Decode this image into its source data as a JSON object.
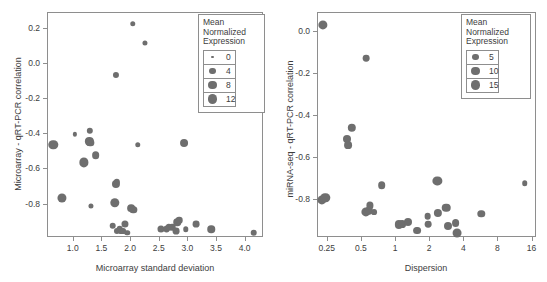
{
  "figure": {
    "title": "",
    "panels": [
      "left",
      "right"
    ]
  },
  "chart_data": [
    {
      "panel_id": "left",
      "type": "scatter",
      "title": "",
      "xlabel": "Microarray standard deviation",
      "ylabel": "Microarray - qRT-PCR correlation",
      "xscale": "linear",
      "yscale": "linear",
      "xlim": [
        0.55,
        4.32
      ],
      "ylim": [
        -0.99,
        0.29
      ],
      "xticks": [
        1.0,
        1.5,
        2.0,
        2.5,
        3.0,
        3.5,
        4.0
      ],
      "xticklabels": [
        "1.0",
        "1.5",
        "2.0",
        "2.5",
        "3.0",
        "3.5",
        "4.0"
      ],
      "yticks": [
        0.2,
        0.0,
        -0.2,
        -0.4,
        -0.6,
        -0.8
      ],
      "yticklabels": [
        "0.2",
        "0.0",
        "-0.2",
        "-0.4",
        "-0.6",
        "-0.8"
      ],
      "grid": false,
      "size_encoding": "Mean Normalized Expression",
      "marker_color": "#6e6e6e",
      "legend": {
        "position": "top-right",
        "title_lines": [
          "Mean",
          "Normalized",
          "Expression"
        ],
        "entries": [
          {
            "label": "0",
            "size": 0
          },
          {
            "label": "4",
            "size": 4
          },
          {
            "label": "8",
            "size": 8
          },
          {
            "label": "12",
            "size": 12
          }
        ]
      },
      "points": [
        {
          "x": 0.64,
          "y": -0.46,
          "size": 12.0
        },
        {
          "x": 0.8,
          "y": -0.76,
          "size": 11.0
        },
        {
          "x": 1.02,
          "y": -0.4,
          "size": 1.0
        },
        {
          "x": 1.17,
          "y": -0.56,
          "size": 11.5
        },
        {
          "x": 1.27,
          "y": -0.44,
          "size": 8.5
        },
        {
          "x": 1.28,
          "y": -0.38,
          "size": 4.0
        },
        {
          "x": 1.29,
          "y": -0.45,
          "size": 6.0
        },
        {
          "x": 1.3,
          "y": -0.81,
          "size": 2.0
        },
        {
          "x": 1.38,
          "y": -0.52,
          "size": 7.0
        },
        {
          "x": 1.68,
          "y": -0.92,
          "size": 4.5
        },
        {
          "x": 1.72,
          "y": -0.79,
          "size": 12.0
        },
        {
          "x": 1.73,
          "y": -0.68,
          "size": 8.0
        },
        {
          "x": 1.74,
          "y": -0.06,
          "size": 3.5
        },
        {
          "x": 1.75,
          "y": -0.67,
          "size": 4.0
        },
        {
          "x": 1.76,
          "y": -0.95,
          "size": 3.5
        },
        {
          "x": 1.8,
          "y": -0.94,
          "size": 4.5
        },
        {
          "x": 1.83,
          "y": -0.95,
          "size": 3.0
        },
        {
          "x": 1.86,
          "y": -0.95,
          "size": 3.0
        },
        {
          "x": 1.89,
          "y": -0.91,
          "size": 5.5
        },
        {
          "x": 1.93,
          "y": -0.96,
          "size": 2.5
        },
        {
          "x": 2.0,
          "y": -0.82,
          "size": 7.0
        },
        {
          "x": 2.03,
          "y": 0.23,
          "size": 2.5
        },
        {
          "x": 2.04,
          "y": -0.83,
          "size": 6.0
        },
        {
          "x": 2.12,
          "y": -0.46,
          "size": 2.5
        },
        {
          "x": 2.24,
          "y": 0.12,
          "size": 2.0
        },
        {
          "x": 2.52,
          "y": -0.94,
          "size": 5.5
        },
        {
          "x": 2.62,
          "y": -0.94,
          "size": 5.0
        },
        {
          "x": 2.66,
          "y": -0.93,
          "size": 4.0
        },
        {
          "x": 2.72,
          "y": -0.93,
          "size": 4.5
        },
        {
          "x": 2.78,
          "y": -0.95,
          "size": 5.0
        },
        {
          "x": 2.81,
          "y": -0.9,
          "size": 6.5
        },
        {
          "x": 2.84,
          "y": -0.89,
          "size": 4.5
        },
        {
          "x": 2.93,
          "y": -0.45,
          "size": 7.5
        },
        {
          "x": 2.95,
          "y": -0.94,
          "size": 2.5
        },
        {
          "x": 3.13,
          "y": -0.91,
          "size": 5.0
        },
        {
          "x": 3.4,
          "y": -0.94,
          "size": 6.5
        },
        {
          "x": 4.14,
          "y": -0.96,
          "size": 4.5
        }
      ]
    },
    {
      "panel_id": "right",
      "type": "scatter",
      "title": "",
      "xlabel": "Dispersion",
      "ylabel": "miRNA-seq - qRT-PCR correlation",
      "xscale": "log2",
      "yscale": "linear",
      "xlim": [
        0.205,
        17.5
      ],
      "ylim": [
        -0.98,
        0.09
      ],
      "xticks": [
        0.25,
        0.5,
        1,
        2,
        4,
        8,
        16
      ],
      "xticklabels": [
        "0.25",
        "0.5",
        "1",
        "2",
        "4",
        "8",
        "16"
      ],
      "yticks": [
        0.0,
        -0.2,
        -0.4,
        -0.6,
        -0.8
      ],
      "yticklabels": [
        "0.0",
        "-0.2",
        "-0.4",
        "-0.6",
        "-0.8"
      ],
      "grid": false,
      "size_encoding": "Mean Normalized Expression",
      "marker_color": "#6e6e6e",
      "legend": {
        "position": "top-right",
        "title_lines": [
          "Mean",
          "Normalized",
          "Expression"
        ],
        "entries": [
          {
            "label": "5",
            "size": 5
          },
          {
            "label": "10",
            "size": 10
          },
          {
            "label": "15",
            "size": 15
          }
        ]
      },
      "points": [
        {
          "x": 0.228,
          "y": 0.035,
          "size": 11.0
        },
        {
          "x": 0.222,
          "y": -0.8,
          "size": 11.0
        },
        {
          "x": 0.238,
          "y": -0.79,
          "size": 11.5
        },
        {
          "x": 0.372,
          "y": -0.51,
          "size": 7.5
        },
        {
          "x": 0.375,
          "y": -0.54,
          "size": 7.0
        },
        {
          "x": 0.405,
          "y": -0.455,
          "size": 8.5
        },
        {
          "x": 0.545,
          "y": -0.125,
          "size": 4.5
        },
        {
          "x": 0.545,
          "y": -0.855,
          "size": 11.0
        },
        {
          "x": 0.575,
          "y": -0.85,
          "size": 8.5
        },
        {
          "x": 0.59,
          "y": -0.825,
          "size": 5.5
        },
        {
          "x": 0.64,
          "y": -0.855,
          "size": 3.0
        },
        {
          "x": 0.745,
          "y": -0.73,
          "size": 6.5
        },
        {
          "x": 1.06,
          "y": -0.915,
          "size": 8.0
        },
        {
          "x": 1.13,
          "y": -0.915,
          "size": 7.0
        },
        {
          "x": 1.27,
          "y": -0.905,
          "size": 7.5
        },
        {
          "x": 1.53,
          "y": -0.945,
          "size": 7.0
        },
        {
          "x": 1.9,
          "y": -0.875,
          "size": 4.5
        },
        {
          "x": 1.93,
          "y": -0.915,
          "size": 4.5
        },
        {
          "x": 2.32,
          "y": -0.71,
          "size": 11.0
        },
        {
          "x": 2.35,
          "y": -0.86,
          "size": 8.0
        },
        {
          "x": 2.78,
          "y": -0.835,
          "size": 9.0
        },
        {
          "x": 2.85,
          "y": -0.925,
          "size": 7.5
        },
        {
          "x": 3.35,
          "y": -0.91,
          "size": 7.0
        },
        {
          "x": 3.42,
          "y": -0.955,
          "size": 10.0
        },
        {
          "x": 5.65,
          "y": -0.865,
          "size": 6.0
        },
        {
          "x": 13.6,
          "y": -0.72,
          "size": 2.5
        }
      ]
    }
  ]
}
